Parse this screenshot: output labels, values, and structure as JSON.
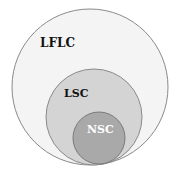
{
  "diagram": {
    "type": "nested-venn",
    "circles": [
      {
        "label": "LFLC",
        "fill": "#f4f4f4",
        "stroke": "#8a8a8a",
        "text_color": "#111111"
      },
      {
        "label": "LSC",
        "fill": "#d4d4d4",
        "stroke": "#8a8a8a",
        "text_color": "#111111"
      },
      {
        "label": "NSC",
        "fill": "#a9a9a9",
        "stroke": "#7a7a7a",
        "text_color": "#ffffff"
      }
    ]
  }
}
